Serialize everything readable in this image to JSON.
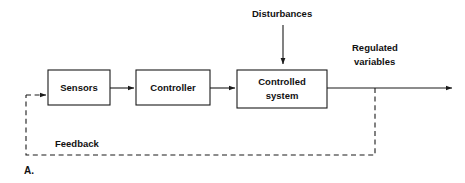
{
  "figure": {
    "label": "A.",
    "width": 465,
    "height": 183,
    "background_color": "#ffffff",
    "line_color": "#1b1b1b",
    "text_color": "#111111"
  },
  "blocks": [
    {
      "id": "sensors",
      "label": "Sensors",
      "x": 48,
      "y": 70,
      "w": 62,
      "h": 35
    },
    {
      "id": "controller",
      "label": "Controller",
      "x": 136,
      "y": 70,
      "w": 74,
      "h": 35
    },
    {
      "id": "controlled-system",
      "label_line1": "Controlled",
      "label_line2": "system",
      "x": 237,
      "y": 70,
      "w": 90,
      "h": 38
    }
  ],
  "labels": {
    "disturbances": "Disturbances",
    "regulated_line1": "Regulated",
    "regulated_line2": "variables",
    "feedback": "Feedback"
  },
  "connections": [
    {
      "id": "sensors-to-controller",
      "style": "solid",
      "from": "sensors",
      "to": "controller",
      "arrow": true
    },
    {
      "id": "controller-to-controlled",
      "style": "solid",
      "from": "controller",
      "to": "controlled-system",
      "arrow": true
    },
    {
      "id": "controlled-to-output",
      "style": "solid",
      "from": "controlled-system",
      "to": "regulated-output",
      "arrow": true
    },
    {
      "id": "disturbances-to-controlled",
      "style": "solid",
      "from": "disturbances",
      "to": "controlled-system",
      "arrow": true
    },
    {
      "id": "output-to-sensors-feedback",
      "style": "dashed",
      "from": "regulated-output",
      "to": "sensors",
      "arrow": true
    }
  ]
}
